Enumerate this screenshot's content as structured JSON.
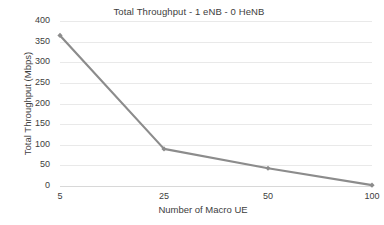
{
  "chart_data": {
    "type": "line",
    "title": "Total Throughput - 1 eNB - 0 HeNB",
    "xlabel": "Number of Macro UE",
    "ylabel": "Total Throughput (Mbps)",
    "categories": [
      "5",
      "25",
      "50",
      "100"
    ],
    "values": [
      365,
      90,
      43,
      2
    ],
    "series": [
      {
        "name": "Total Throughput",
        "values": [
          365,
          90,
          43,
          2
        ],
        "color": "#8c8c8c",
        "marker": "diamond"
      }
    ],
    "ylim": [
      0,
      400
    ],
    "yticks": [
      "0",
      "50",
      "100",
      "150",
      "200",
      "250",
      "300",
      "350",
      "400"
    ],
    "ytick_values": [
      0,
      50,
      100,
      150,
      200,
      250,
      300,
      350,
      400
    ],
    "grid": "horizontal",
    "legend": "none",
    "background": "#ffffff",
    "gridline_color": "#e9e9e9",
    "axis_color": "#d8d8d8",
    "line_color": "#8c8c8c",
    "text_color": "#3d3d3d"
  }
}
